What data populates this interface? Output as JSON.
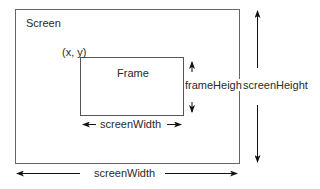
{
  "diagram": {
    "screen": {
      "label": "Screen"
    },
    "frame": {
      "label": "Frame",
      "origin_label": "(x, y)"
    },
    "dimensions": {
      "frame_width_label": "screenWidth",
      "frame_height_label": "frameHeight",
      "screen_width_label": "screenWidth",
      "screen_height_label": "screenHeight"
    },
    "colors": {
      "line": "#555555",
      "arrow": "#111111",
      "background": "#ffffff"
    }
  }
}
